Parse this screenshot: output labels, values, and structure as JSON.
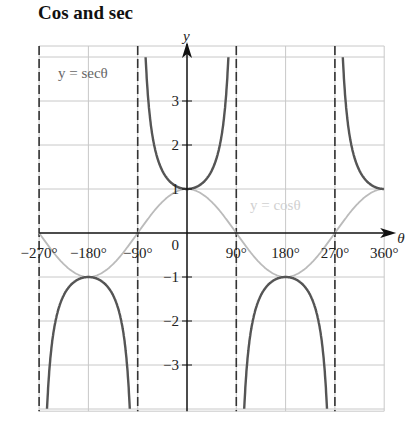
{
  "title": "Cos and sec",
  "chart_data": {
    "type": "line",
    "title": "Cos and sec",
    "xlabel": "θ",
    "ylabel": "y",
    "x_unit": "degrees",
    "xlim": [
      -270,
      360
    ],
    "ylim": [
      -4.05,
      4.25
    ],
    "grid": true,
    "x_ticks": [
      "-270°",
      "-180°",
      "-90°",
      "0",
      "90°",
      "180°",
      "270°",
      "360°"
    ],
    "y_ticks": [
      "3",
      "2",
      "1",
      "-1",
      "-2",
      "-3"
    ],
    "asymptotes": [
      -270,
      -90,
      90,
      270
    ],
    "series": [
      {
        "name": "y = secθ",
        "color": "#555555",
        "function": "sec",
        "x": [
          -180,
          -90,
          0,
          90,
          180,
          270,
          360
        ],
        "y": [
          -1,
          null,
          1,
          null,
          -1,
          null,
          1
        ]
      },
      {
        "name": "y = cosθ",
        "color": "#bbbbbb",
        "function": "cos",
        "x": [
          -270,
          -180,
          -90,
          0,
          90,
          180,
          270,
          360
        ],
        "y": [
          0,
          -1,
          0,
          1,
          0,
          -1,
          0,
          1
        ]
      }
    ],
    "annotations": [
      "y = secθ",
      "y = cosθ"
    ]
  },
  "labels": {
    "sec_label": "y = secθ",
    "cos_label": "y = cosθ",
    "x_axis": "θ",
    "y_axis": "y",
    "origin": "0"
  }
}
